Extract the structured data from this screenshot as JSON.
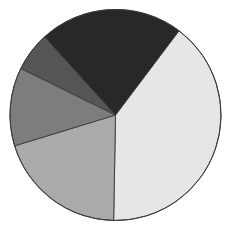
{
  "chart_data": {
    "type": "pie",
    "title": "",
    "labels": [
      "",
      "",
      "",
      "",
      ""
    ],
    "values": [
      40,
      20,
      12,
      6,
      22
    ],
    "colors": [
      "#e6e6e6",
      "#aaaaaa",
      "#7d7d7d",
      "#555555",
      "#282828"
    ],
    "start_angle_deg": 37,
    "direction": "clockwise",
    "legend": "none",
    "data_labels": "none",
    "center": [
      115.5,
      115
    ],
    "radius": 105.5,
    "edge_color": "#3a3a3a"
  }
}
